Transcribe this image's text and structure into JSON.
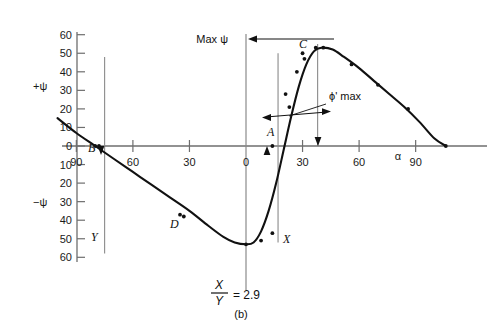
{
  "figure": {
    "caption": "(b)",
    "ratio_numerator": "X",
    "ratio_denominator": "Y",
    "ratio_equals": "= 2.9"
  },
  "annotations": {
    "max_psi": "Max ψ",
    "phi_max": "ϕ' max",
    "x_marker": "X",
    "y_marker": "Y",
    "point_A": "A",
    "point_B": "B",
    "point_C": "C",
    "point_D": "D"
  },
  "chart_data": {
    "type": "line",
    "title": "",
    "xlabel": "α",
    "ylabel_positive": "+ψ",
    "ylabel_negative": "−ψ",
    "xlim": [
      -100,
      110
    ],
    "ylim": [
      -62,
      62
    ],
    "grid": false,
    "legend": "none",
    "xticks": [
      -90,
      -60,
      -30,
      0,
      30,
      60,
      90
    ],
    "xticklabels": [
      "90",
      "60",
      "30",
      "0",
      "30",
      "60",
      "90"
    ],
    "yticks": [
      60,
      50,
      40,
      30,
      20,
      10,
      0,
      -10,
      -20,
      -30,
      -40,
      -50,
      -60
    ],
    "yticklabels": [
      "60",
      "50",
      "40",
      "30",
      "20",
      "10",
      "0",
      "10",
      "20",
      "30",
      "40",
      "50",
      "60"
    ],
    "series": [
      {
        "name": "psi curve",
        "x": [
          -100,
          -90,
          -80,
          -70,
          -60,
          -50,
          -40,
          -30,
          -20,
          -12,
          -6,
          0,
          4,
          8,
          12,
          16,
          20,
          24,
          28,
          32,
          36,
          40,
          46,
          52,
          60,
          68,
          76,
          84,
          92,
          100,
          106
        ],
        "y": [
          15,
          7,
          0,
          -7,
          -14,
          -21,
          -28,
          -35,
          -43,
          -49,
          -52,
          -53,
          -52,
          -46,
          -35,
          -20,
          -2,
          16,
          32,
          44,
          51,
          53,
          52,
          48,
          42,
          35,
          28,
          21,
          13,
          4,
          0
        ]
      }
    ],
    "scatter": {
      "name": "data points",
      "x": [
        -80,
        -33,
        0,
        8,
        14,
        21,
        23,
        27,
        31,
        37,
        41,
        56,
        70,
        86,
        106
      ],
      "y": [
        0,
        -38,
        -53,
        -51,
        -47,
        28,
        21,
        40,
        47,
        53,
        53,
        44,
        33,
        20,
        0
      ]
    },
    "markers": {
      "A": {
        "x": 14,
        "y": 0
      },
      "B": {
        "x": -78,
        "y": 0
      },
      "C": {
        "x": 30,
        "y": 50
      },
      "D": {
        "x": -35,
        "y": -37
      }
    },
    "vertical_lines": [
      {
        "name": "Y-line",
        "x": -75,
        "y_top": 48,
        "y_bottom": -58
      },
      {
        "name": "X-line",
        "x": 17,
        "y_top": 50,
        "y_bottom": -52
      },
      {
        "name": "max-line",
        "x": 38,
        "y_top": 55,
        "y_bottom": 0
      }
    ]
  }
}
